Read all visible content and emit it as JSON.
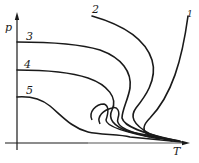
{
  "diagram": {
    "axes": {
      "y_label": "p",
      "x_label": "T"
    },
    "curves": [
      {
        "id": "1",
        "label": "1"
      },
      {
        "id": "2",
        "label": "2"
      },
      {
        "id": "3",
        "label": "3"
      },
      {
        "id": "4",
        "label": "4"
      },
      {
        "id": "5",
        "label": "5"
      }
    ],
    "colors": {
      "line": "#1a1a1a",
      "background": "#ffffff"
    }
  }
}
